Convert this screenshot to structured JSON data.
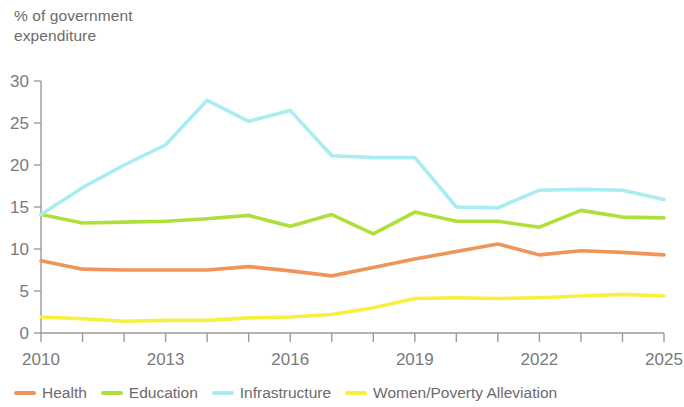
{
  "axis_title": "% of government\nexpenditure",
  "legend": {
    "items": [
      {
        "label": "Health",
        "color": "#F0955A"
      },
      {
        "label": "Education",
        "color": "#AEE03C"
      },
      {
        "label": "Infrastructure",
        "color": "#A9EDF0"
      },
      {
        "label": "Women/Poverty Alleviation",
        "color": "#F7F040"
      }
    ]
  },
  "chart_data": {
    "type": "line",
    "title": "",
    "subtitle": "",
    "xlabel": "",
    "ylabel": "% of government expenditure",
    "xlim": [
      2010,
      2025
    ],
    "ylim": [
      0,
      30
    ],
    "grid": false,
    "legend_position": "bottom",
    "x": [
      2010,
      2011,
      2012,
      2013,
      2014,
      2015,
      2016,
      2017,
      2018,
      2019,
      2020,
      2021,
      2022,
      2023,
      2024,
      2025
    ],
    "x_tick_labels": [
      "2010",
      "",
      "",
      "2013",
      "",
      "",
      "2016",
      "",
      "",
      "2019",
      "",
      "",
      "2022",
      "",
      "",
      "2025"
    ],
    "y_ticks": [
      0,
      5,
      10,
      15,
      20,
      25,
      30
    ],
    "y_tick_labels": [
      "0",
      "5",
      "10",
      "15",
      "20",
      "25",
      "30"
    ],
    "series": [
      {
        "name": "Health",
        "color": "#F0955A",
        "values": [
          8.6,
          7.6,
          7.5,
          7.5,
          7.5,
          7.9,
          7.4,
          6.8,
          7.8,
          8.8,
          9.7,
          10.6,
          9.3,
          9.8,
          9.6,
          9.3
        ]
      },
      {
        "name": "Education",
        "color": "#AEE03C",
        "values": [
          14.1,
          13.1,
          13.2,
          13.3,
          13.6,
          14.0,
          12.7,
          14.1,
          11.8,
          14.4,
          13.3,
          13.3,
          12.6,
          14.6,
          13.8,
          13.7
        ]
      },
      {
        "name": "Infrastructure",
        "color": "#A9EDF0",
        "values": [
          14.1,
          17.3,
          20.0,
          22.4,
          27.7,
          25.2,
          26.5,
          21.1,
          20.9,
          20.9,
          15.0,
          14.9,
          17.0,
          17.1,
          17.0,
          15.9
        ]
      },
      {
        "name": "Women/Poverty Alleviation",
        "color": "#F7F040",
        "values": [
          1.9,
          1.7,
          1.4,
          1.5,
          1.5,
          1.8,
          1.9,
          2.2,
          3.0,
          4.1,
          4.2,
          4.1,
          4.2,
          4.4,
          4.6,
          4.4
        ]
      }
    ]
  }
}
